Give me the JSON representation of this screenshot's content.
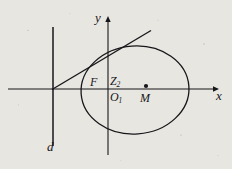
{
  "figure": {
    "kind": "geometry-diagram",
    "background_color": "#e8e6e1",
    "ink_color": "#17161a",
    "labels": {
      "y_axis": "y",
      "x_axis": "x",
      "directrix": "d",
      "focus": "F",
      "point_z2": "Z",
      "point_z2_sub": "2",
      "origin": "O",
      "origin_sub": "1",
      "center": "M"
    },
    "geometry": {
      "x_axis": {
        "x1": 8,
        "y1": 89,
        "x2": 213,
        "y2": 89,
        "arrow": "right"
      },
      "y_axis": {
        "x1": 108,
        "y1": 155,
        "x2": 108,
        "y2": 19,
        "arrow": "up"
      },
      "directrix": {
        "x1": 53,
        "y1": 27,
        "x2": 53,
        "y2": 146,
        "arrow": "none"
      },
      "tangent_line": {
        "x1": 53,
        "y1": 89,
        "x2": 150,
        "y2": 31
      },
      "ellipse": {
        "cx": 135,
        "cy": 90,
        "rx": 54,
        "ry": 44,
        "rotation": -4
      },
      "center_dot": {
        "cx": 146,
        "cy": 86,
        "r": 2.1
      }
    }
  }
}
